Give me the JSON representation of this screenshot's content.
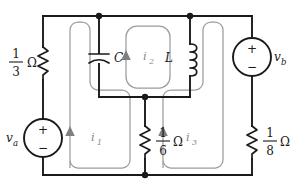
{
  "diagram": {
    "background_color": "#ffffff",
    "wire_color": "#1a1a1a",
    "mesh_color": "#9c9c9c"
  },
  "components": {
    "resistor_left": {
      "name": "resistor-one-third",
      "numerator": "1",
      "denominator": "3",
      "unit": "Ω"
    },
    "resistor_middle": {
      "name": "resistor-one-sixth",
      "numerator": "1",
      "denominator": "6",
      "unit": "Ω"
    },
    "resistor_right": {
      "name": "resistor-one-eighth",
      "numerator": "1",
      "denominator": "8",
      "unit": "Ω"
    },
    "capacitor": {
      "name": "capacitor-c",
      "label": "C"
    },
    "inductor": {
      "name": "inductor-l",
      "label": "L"
    },
    "source_left": {
      "name": "voltage-source-va",
      "label": "v",
      "subscript": "a",
      "plus": "+",
      "minus": "−"
    },
    "source_right": {
      "name": "voltage-source-vb",
      "label": "v",
      "subscript": "b",
      "plus": "+",
      "minus": "−"
    }
  },
  "mesh_currents": [
    {
      "name": "mesh-current-i1",
      "label": "i",
      "subscript": "1",
      "direction": "counterclockwise"
    },
    {
      "name": "mesh-current-i2",
      "label": "i",
      "subscript": "2",
      "direction": "counterclockwise"
    },
    {
      "name": "mesh-current-i3",
      "label": "i",
      "subscript": "3",
      "direction": "counterclockwise"
    }
  ],
  "nodes": [
    {
      "name": "node-top-capacitor",
      "x": 99,
      "y": 16
    },
    {
      "name": "node-top-inductor",
      "x": 190,
      "y": 16
    },
    {
      "name": "node-middle-junction",
      "x": 145,
      "y": 97
    },
    {
      "name": "node-bottom-junction",
      "x": 145,
      "y": 175
    }
  ]
}
